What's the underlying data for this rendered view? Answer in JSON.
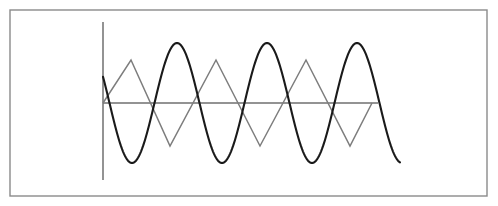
{
  "figure": {
    "background_color": "#ffffff",
    "border": {
      "name": "figure-frame",
      "x": 10,
      "y": 10,
      "width": 477,
      "height": 186,
      "color": "#8a8a8a",
      "stroke_width": 1.4
    },
    "axes": {
      "color": "#6f6f6f",
      "stroke_width": 1.5,
      "origin_x": 103,
      "origin_y": 103,
      "vertical_top": 22,
      "vertical_bottom": 180,
      "horizontal_right": 378
    }
  },
  "chart_data": {
    "type": "line",
    "title": "",
    "subtitle": "",
    "xlabel": "",
    "ylabel": "",
    "grid": false,
    "legend": null,
    "xlim": [
      103,
      400
    ],
    "ylim": [
      -60,
      60
    ],
    "axis_origin": {
      "x": 103,
      "y": 103
    },
    "annotations": [],
    "series": [
      {
        "name": "sine-wave",
        "waveform": "sinusoid",
        "color": "#1a1a1a",
        "stroke_width": 2.1,
        "amplitude": 60,
        "period": 90,
        "phase_offset_px": -16,
        "x_start": 103,
        "x_end": 400,
        "description": "smooth sinusoidal curve, descending at the left edge, three full crests",
        "key_points": [
          {
            "x": 103,
            "y": 44
          },
          {
            "x": 130,
            "y": 103
          },
          {
            "x": 175,
            "y": 31
          },
          {
            "x": 220,
            "y": 103
          },
          {
            "x": 265,
            "y": 31
          },
          {
            "x": 310,
            "y": 103
          },
          {
            "x": 355,
            "y": 31
          },
          {
            "x": 385,
            "y": 44
          }
        ]
      },
      {
        "name": "triangle-wave",
        "waveform": "triangle",
        "color": "#7d7d7d",
        "stroke_width": 1.5,
        "amplitude": 43,
        "period": 90,
        "x_start": 103,
        "x_end": 372,
        "description": "grey triangular wave starting at the origin and rising first",
        "vertices": [
          {
            "x": 103,
            "y": 103
          },
          {
            "x": 131,
            "y": 60
          },
          {
            "x": 170,
            "y": 146
          },
          {
            "x": 216,
            "y": 60
          },
          {
            "x": 260,
            "y": 146
          },
          {
            "x": 306,
            "y": 60
          },
          {
            "x": 350,
            "y": 146
          },
          {
            "x": 372,
            "y": 103
          }
        ]
      }
    ]
  }
}
